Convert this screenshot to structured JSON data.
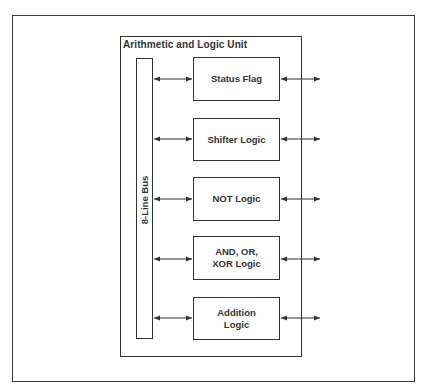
{
  "diagram": {
    "container_title": "Arithmetic and Logic Unit",
    "bus_label": "8-Line Bus",
    "units": [
      {
        "label": "Status Flag"
      },
      {
        "label": "Shifter Logic"
      },
      {
        "label": "NOT Logic"
      },
      {
        "label": "AND, OR, XOR Logic"
      },
      {
        "label": "Addition Logic"
      }
    ],
    "connections": [
      {
        "from": "8-Line Bus",
        "to": "Status Flag",
        "type": "bidirectional"
      },
      {
        "from": "8-Line Bus",
        "to": "Shifter Logic",
        "type": "bidirectional"
      },
      {
        "from": "8-Line Bus",
        "to": "NOT Logic",
        "type": "bidirectional"
      },
      {
        "from": "8-Line Bus",
        "to": "AND, OR, XOR Logic",
        "type": "bidirectional"
      },
      {
        "from": "8-Line Bus",
        "to": "Addition Logic",
        "type": "bidirectional"
      },
      {
        "from": "Status Flag",
        "to": "external",
        "type": "bidirectional"
      },
      {
        "from": "Shifter Logic",
        "to": "external",
        "type": "bidirectional"
      },
      {
        "from": "NOT Logic",
        "to": "external",
        "type": "bidirectional"
      },
      {
        "from": "AND, OR, XOR Logic",
        "to": "external",
        "type": "bidirectional"
      },
      {
        "from": "Addition Logic",
        "to": "external",
        "type": "bidirectional"
      }
    ],
    "colors": {
      "line": "#333333",
      "background": "#ffffff"
    }
  }
}
